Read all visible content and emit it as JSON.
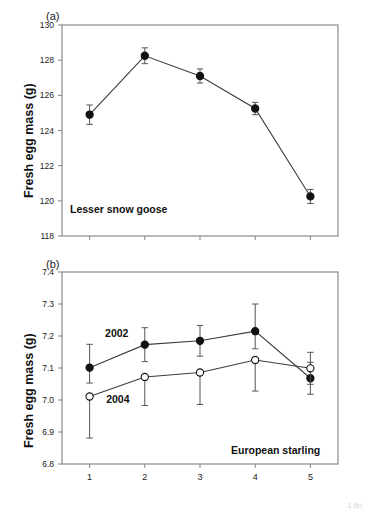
{
  "figure": {
    "panels": [
      {
        "tag": "(a)",
        "species_label": "Lesser snow goose",
        "ylabel": "Fresh egg mass (g)"
      },
      {
        "tag": "(b)",
        "species_label": "European starling",
        "ylabel": "Fresh egg mass (g)"
      }
    ],
    "bottom_caption_fragment": "1 (b)"
  },
  "chart_data": [
    {
      "type": "line",
      "panel": "(a)",
      "title": "Lesser snow goose",
      "xlabel": "",
      "ylabel": "Fresh egg mass (g)",
      "x": [
        1,
        2,
        3,
        4,
        5
      ],
      "xtick_labels": [
        "",
        "",
        "",
        "",
        ""
      ],
      "xlim": [
        0.5,
        5.5
      ],
      "ylim": [
        118,
        130
      ],
      "ytick_labels": [
        "118",
        "120",
        "122",
        "124",
        "126",
        "128",
        "130"
      ],
      "yticks": [
        118,
        120,
        122,
        124,
        126,
        128,
        130
      ],
      "grid": false,
      "legend": "none",
      "series": [
        {
          "name": "Lesser snow goose",
          "marker": "filled-circle",
          "values": [
            124.9,
            128.25,
            127.1,
            125.25,
            120.25
          ],
          "err_low": [
            0.55,
            0.45,
            0.4,
            0.35,
            0.4
          ],
          "err_high": [
            0.55,
            0.45,
            0.4,
            0.35,
            0.4
          ]
        }
      ]
    },
    {
      "type": "line",
      "panel": "(b)",
      "title": "European starling",
      "xlabel": "",
      "ylabel": "Fresh egg mass (g)",
      "x": [
        1,
        2,
        3,
        4,
        5
      ],
      "xtick_labels": [
        "1",
        "2",
        "3",
        "4",
        "5"
      ],
      "xlim": [
        0.5,
        5.5
      ],
      "ylim": [
        6.8,
        7.4
      ],
      "ytick_labels": [
        "6.8",
        "6.9",
        "7.0",
        "7.1",
        "7.2",
        "7.3",
        "7.4"
      ],
      "yticks": [
        6.8,
        6.9,
        7.0,
        7.1,
        7.2,
        7.3,
        7.4
      ],
      "grid": false,
      "legend": "inline-labels",
      "series": [
        {
          "name": "2002",
          "marker": "filled-circle",
          "values": [
            7.101,
            7.173,
            7.185,
            7.215,
            7.068
          ],
          "err_low": [
            0.048,
            0.053,
            0.048,
            0.055,
            0.05
          ],
          "err_high": [
            0.073,
            0.053,
            0.048,
            0.085,
            0.05
          ]
        },
        {
          "name": "2004",
          "marker": "open-circle",
          "values": [
            7.011,
            7.072,
            7.086,
            7.125,
            7.099
          ],
          "err_low": [
            0.13,
            0.089,
            0.1,
            0.097,
            0.05
          ],
          "err_high": [
            0.0,
            0.0,
            0.0,
            0.0,
            0.05
          ]
        }
      ]
    }
  ]
}
